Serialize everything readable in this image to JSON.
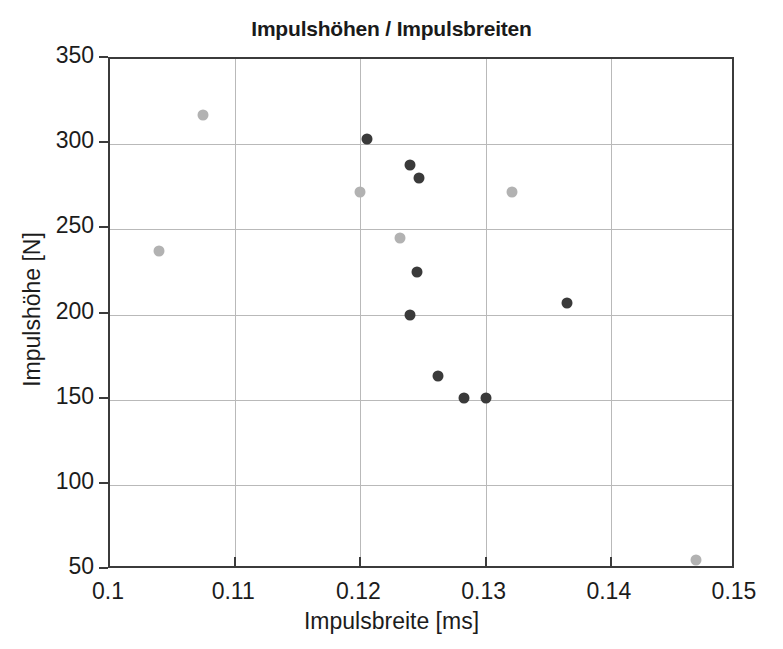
{
  "chart_data": {
    "type": "scatter",
    "title": "Impulshöhen / Impulsbreiten",
    "xlabel": "Impulsbreite [ms]",
    "ylabel": "Impulshöhe [N]",
    "xlim": [
      0.1,
      0.15
    ],
    "ylim": [
      50,
      350
    ],
    "xticks": [
      "0.1",
      "0.11",
      "0.12",
      "0.13",
      "0.14",
      "0.15"
    ],
    "xtick_values": [
      0.1,
      0.11,
      0.12,
      0.13,
      0.14,
      0.15
    ],
    "yticks": [
      "50",
      "100",
      "150",
      "200",
      "250",
      "300",
      "350"
    ],
    "ytick_values": [
      50,
      100,
      150,
      200,
      250,
      300,
      350
    ],
    "grid": true,
    "legend": "none",
    "colors": {
      "dark_marker": "#3a3a3a",
      "light_marker": "#b2b2b2",
      "gridline": "#b9b9b9",
      "axis": "#3b3b3b",
      "background": "#ffffff"
    },
    "series": [
      {
        "name": "dark",
        "color": "#3a3a3a",
        "points": [
          {
            "x": 0.1205,
            "y": 303
          },
          {
            "x": 0.124,
            "y": 288
          },
          {
            "x": 0.1247,
            "y": 280
          },
          {
            "x": 0.1245,
            "y": 225
          },
          {
            "x": 0.124,
            "y": 200
          },
          {
            "x": 0.1262,
            "y": 164
          },
          {
            "x": 0.1283,
            "y": 151
          },
          {
            "x": 0.13,
            "y": 151
          },
          {
            "x": 0.1365,
            "y": 207
          }
        ]
      },
      {
        "name": "light",
        "color": "#b2b2b2",
        "points": [
          {
            "x": 0.1039,
            "y": 237
          },
          {
            "x": 0.1074,
            "y": 317
          },
          {
            "x": 0.12,
            "y": 272
          },
          {
            "x": 0.1232,
            "y": 245
          },
          {
            "x": 0.1321,
            "y": 272
          },
          {
            "x": 0.1468,
            "y": 56
          }
        ]
      }
    ]
  }
}
